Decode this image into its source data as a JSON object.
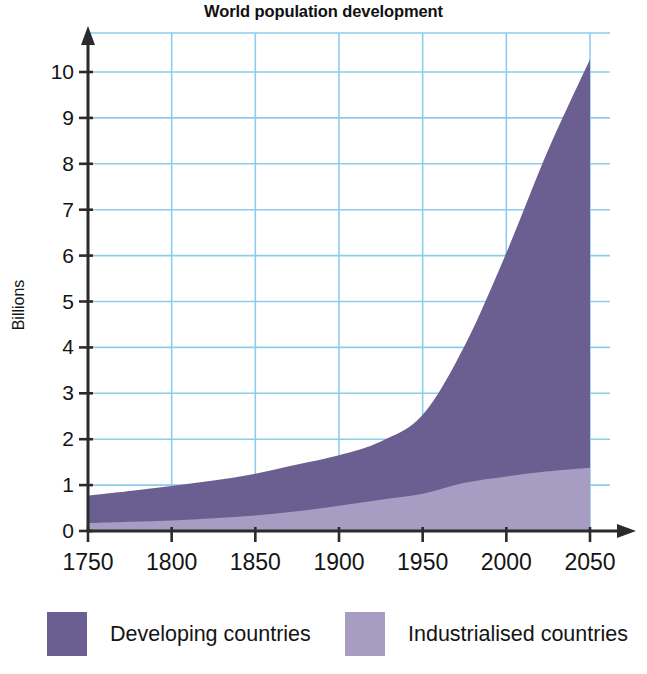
{
  "chart": {
    "title": "World population development",
    "ylabel": "Billions"
  },
  "legend": {
    "items": [
      {
        "label": "Developing countries",
        "color": "#6b5f91",
        "swatch_name": "legend-swatch-developing"
      },
      {
        "label": "Industrialised countries",
        "color": "#a79cc2",
        "swatch_name": "legend-swatch-industrialised"
      }
    ]
  },
  "axes": {
    "y_ticks": [
      "0",
      "1",
      "2",
      "3",
      "4",
      "5",
      "6",
      "7",
      "8",
      "9",
      "10"
    ],
    "x_ticks": [
      "1750",
      "1800",
      "1850",
      "1900",
      "1950",
      "2000",
      "2050"
    ]
  },
  "chart_data": {
    "type": "area",
    "title": "World population development",
    "xlabel": "",
    "ylabel": "Billions",
    "stacked": true,
    "grid": true,
    "legend_position": "bottom",
    "xlim": [
      1750,
      2050
    ],
    "ylim": [
      0,
      10.8
    ],
    "xticks": [
      1750,
      1800,
      1850,
      1900,
      1950,
      2000,
      2050
    ],
    "yticks": [
      0,
      1,
      2,
      3,
      4,
      5,
      6,
      7,
      8,
      9,
      10
    ],
    "x": [
      1750,
      1775,
      1800,
      1825,
      1850,
      1875,
      1900,
      1925,
      1950,
      1975,
      2000,
      2025,
      2050
    ],
    "series": [
      {
        "name": "Industrialised countries",
        "color": "#a79cc2",
        "values": [
          0.17,
          0.2,
          0.23,
          0.28,
          0.34,
          0.43,
          0.55,
          0.68,
          0.81,
          1.05,
          1.19,
          1.3,
          1.38
        ]
      },
      {
        "name": "Developing countries",
        "color": "#6b5f91",
        "values": [
          0.6,
          0.67,
          0.75,
          0.82,
          0.91,
          1.02,
          1.1,
          1.27,
          1.72,
          2.98,
          4.87,
          7.0,
          8.9
        ]
      }
    ],
    "totals": [
      0.77,
      0.87,
      0.98,
      1.1,
      1.25,
      1.45,
      1.65,
      1.95,
      2.53,
      4.03,
      6.06,
      8.3,
      10.28
    ],
    "annotations": []
  }
}
